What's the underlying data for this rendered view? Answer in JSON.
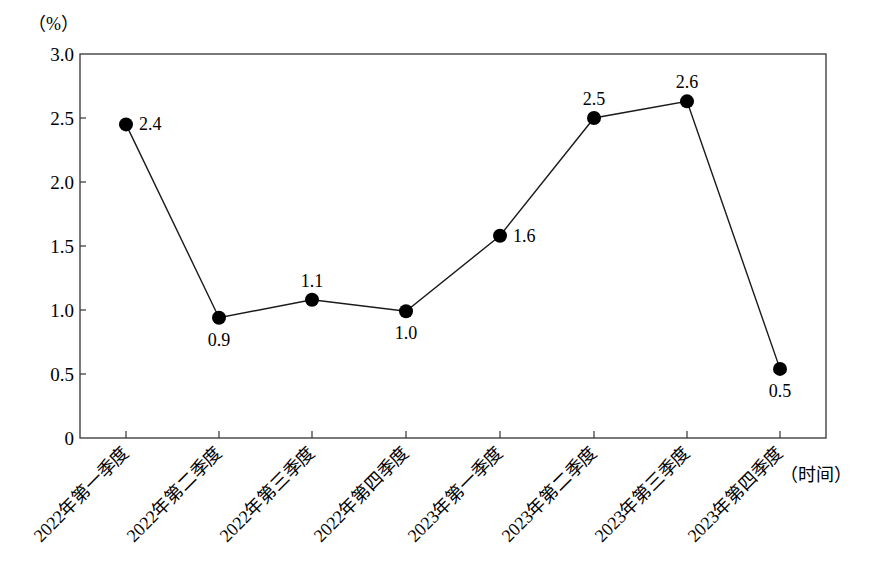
{
  "chart_data": {
    "type": "line",
    "title": "",
    "ylabel": "(%)",
    "xlabel": "(时间)",
    "ylim": [
      0,
      3.0
    ],
    "yticks": [
      "0",
      "0.5",
      "1.0",
      "1.5",
      "2.0",
      "2.5",
      "3.0"
    ],
    "grid": false,
    "legend": null,
    "categories": [
      "2022年第一季度",
      "2022年第二季度",
      "2022年第三季度",
      "2022年第四季度",
      "2023年第一季度",
      "2023年第二季度",
      "2023年第三季度",
      "2023年第四季度"
    ],
    "values": [
      2.4,
      0.9,
      1.1,
      1.0,
      1.6,
      2.5,
      2.6,
      0.5
    ],
    "plotted_positions": [
      2.45,
      0.94,
      1.08,
      0.99,
      1.58,
      2.5,
      2.63,
      0.54
    ],
    "data_labels": [
      "2.4",
      "0.9",
      "1.1",
      "1.0",
      "1.6",
      "2.5",
      "2.6",
      "0.5"
    ],
    "label_positions": [
      "right",
      "below",
      "above",
      "below",
      "right",
      "above",
      "above",
      "below"
    ],
    "marker": "filled-circle",
    "line_color": "#1a1a1a",
    "marker_color": "#000000"
  },
  "axis": {
    "y_unit": "（%）",
    "x_unit": "（时间）"
  }
}
